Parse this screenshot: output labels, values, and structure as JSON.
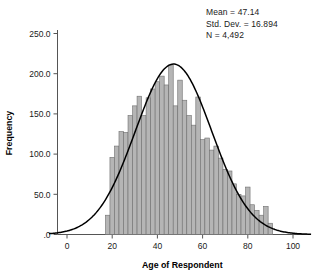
{
  "chart_data": {
    "type": "bar",
    "title": "",
    "xlabel": "Age of Respondent",
    "ylabel": "Frequency",
    "xlim": [
      -8,
      108
    ],
    "ylim": [
      0,
      262
    ],
    "xticks": [
      "0",
      "20",
      "40",
      "60",
      "80",
      "100"
    ],
    "xtick_values": [
      0,
      20,
      40,
      60,
      80,
      100
    ],
    "yticks": [
      ".0",
      "50.0",
      "100.0",
      "150.0",
      "200.0",
      "250.0"
    ],
    "ytick_values": [
      0,
      50,
      100,
      150,
      200,
      250
    ],
    "grid": false,
    "legend_position": "top-right",
    "bin_width": 2,
    "categories": [
      18,
      20,
      22,
      24,
      26,
      28,
      30,
      32,
      34,
      36,
      38,
      40,
      42,
      44,
      46,
      48,
      50,
      52,
      54,
      56,
      58,
      60,
      62,
      64,
      66,
      68,
      70,
      72,
      74,
      76,
      78,
      80,
      82,
      84,
      86,
      88,
      90
    ],
    "values": [
      24,
      96,
      110,
      128,
      127,
      148,
      160,
      172,
      148,
      170,
      181,
      190,
      197,
      186,
      211,
      160,
      192,
      167,
      148,
      136,
      171,
      118,
      120,
      105,
      110,
      95,
      81,
      79,
      63,
      50,
      48,
      59,
      37,
      30,
      24,
      35,
      14
    ],
    "overlay": {
      "type": "normal-curve",
      "mean": 47.14,
      "std_dev": 16.894,
      "peak_value": 212
    },
    "annotations": {
      "mean_label": "Mean = 47.14",
      "std_label": "Std. Dev. = 16.894",
      "n_label": "N = 4,492"
    }
  },
  "stats": {
    "mean": "Mean = 47.14",
    "std_dev": "Std. Dev. = 16.894",
    "n": "N = 4,492"
  },
  "axes": {
    "x_title": "Age of Respondent",
    "y_title": "Frequency"
  }
}
